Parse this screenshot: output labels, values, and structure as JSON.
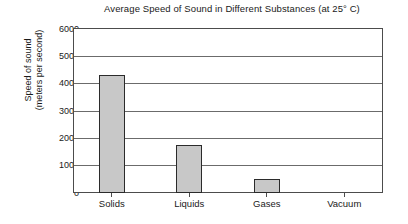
{
  "chart_data": {
    "type": "bar",
    "title": "Average Speed of Sound in Different Substances (at 25° C)",
    "xlabel": "",
    "ylabel": "Speed of sound (meters per second)",
    "ylabel_lines": [
      "Speed of sound",
      "(meters per second)"
    ],
    "categories": [
      "Solids",
      "Liquids",
      "Gases",
      "Vacuum"
    ],
    "values": [
      4350,
      1750,
      500,
      0
    ],
    "ylim": [
      0,
      6000
    ],
    "ytick_step": 1000,
    "yticks": [
      6000,
      5000,
      4000,
      3000,
      2000,
      1000,
      0
    ],
    "ytick_labels": [
      "6000",
      "5000",
      "4000",
      "3000",
      "2000",
      "1000",
      "0"
    ],
    "grid": true,
    "grid_axis": "y",
    "legend": false,
    "legend_position": "none",
    "bar_color": "#c8c8c8",
    "bar_edge_color": "#2b2b2b",
    "background_color": "#ffffff",
    "frame_color": "#4c4c4c"
  },
  "axis": {
    "y_title_line1": "Speed of sound",
    "y_title_line2": "(meters per second)"
  },
  "ytick_labels": {
    "t0": "6000",
    "t1": "5000",
    "t2": "4000",
    "t3": "3000",
    "t4": "2000",
    "t5": "1000",
    "t6": "0"
  },
  "xtick_labels": {
    "c0": "Solids",
    "c1": "Liquids",
    "c2": "Gases",
    "c3": "Vacuum"
  }
}
